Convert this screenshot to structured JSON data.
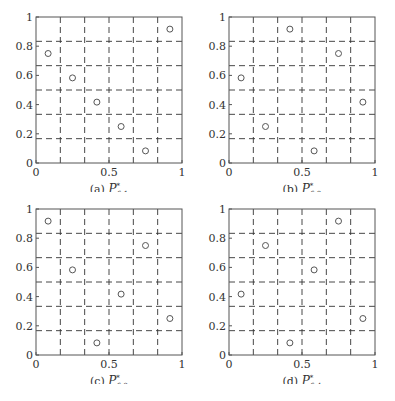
{
  "figure": {
    "grid_divisions": 6,
    "axis_color": "#555555",
    "grid_color": "#333333",
    "marker_color": "#555555"
  },
  "chart_data": [
    {
      "type": "scatter",
      "title": "(a) P*_{6-1}",
      "caption_prefix": "(a)",
      "caption_symbol": "P",
      "caption_sup": "*",
      "caption_sub": "6-1",
      "xlabel": "",
      "ylabel": "",
      "xlim": [
        0,
        1
      ],
      "ylim": [
        0,
        1
      ],
      "xticks": [
        "0",
        "0.5",
        "1"
      ],
      "yticks": [
        "0",
        "0.2",
        "0.4",
        "0.6",
        "0.8",
        "1"
      ],
      "grid": "dashed, 1/6 spacing",
      "x": [
        0.083,
        0.25,
        0.417,
        0.583,
        0.75,
        0.917
      ],
      "y": [
        0.75,
        0.583,
        0.417,
        0.25,
        0.083,
        0.917
      ]
    },
    {
      "type": "scatter",
      "title": "(b) P*_{6-2}",
      "caption_prefix": "(b)",
      "caption_symbol": "P",
      "caption_sup": "*",
      "caption_sub": "6-2",
      "xlabel": "",
      "ylabel": "",
      "xlim": [
        0,
        1
      ],
      "ylim": [
        0,
        1
      ],
      "xticks": [
        "0",
        "0.5",
        "1"
      ],
      "yticks": [
        "0",
        "0.2",
        "0.4",
        "0.6",
        "0.8",
        "1"
      ],
      "grid": "dashed, 1/6 spacing",
      "x": [
        0.083,
        0.25,
        0.417,
        0.583,
        0.75,
        0.917
      ],
      "y": [
        0.583,
        0.25,
        0.917,
        0.083,
        0.75,
        0.417
      ]
    },
    {
      "type": "scatter",
      "title": "(c) P*_{6-3}",
      "caption_prefix": "(c)",
      "caption_symbol": "P",
      "caption_sup": "*",
      "caption_sub": "6-3",
      "xlabel": "",
      "ylabel": "",
      "xlim": [
        0,
        1
      ],
      "ylim": [
        0,
        1
      ],
      "xticks": [
        "0",
        "0.5",
        "1"
      ],
      "yticks": [
        "0",
        "0.2",
        "0.4",
        "0.6",
        "0.8",
        "1"
      ],
      "grid": "dashed, 1/6 spacing",
      "x": [
        0.083,
        0.25,
        0.417,
        0.583,
        0.75,
        0.917
      ],
      "y": [
        0.917,
        0.583,
        0.083,
        0.417,
        0.75,
        0.25
      ]
    },
    {
      "type": "scatter",
      "title": "(d) P*_{6-4}",
      "caption_prefix": "(d)",
      "caption_symbol": "P",
      "caption_sup": "*",
      "caption_sub": "6-4",
      "xlabel": "",
      "ylabel": "",
      "xlim": [
        0,
        1
      ],
      "ylim": [
        0,
        1
      ],
      "xticks": [
        "0",
        "0.5",
        "1"
      ],
      "yticks": [
        "0",
        "0.2",
        "0.4",
        "0.6",
        "0.8",
        "1"
      ],
      "grid": "dashed, 1/6 spacing",
      "x": [
        0.083,
        0.25,
        0.417,
        0.583,
        0.75,
        0.917
      ],
      "y": [
        0.417,
        0.75,
        0.083,
        0.583,
        0.917,
        0.25
      ]
    }
  ]
}
